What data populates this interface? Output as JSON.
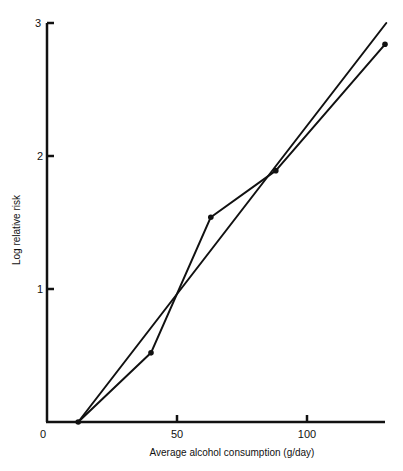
{
  "chart_data": {
    "type": "line",
    "title": "",
    "xlabel": "Average alcohol consumption (g/day)",
    "ylabel": "Log relative risk",
    "xlim": [
      0,
      131
    ],
    "ylim": [
      0,
      3
    ],
    "x_ticks": [
      0,
      50,
      100
    ],
    "y_ticks": [
      1,
      2,
      3
    ],
    "x_tick_labels": [
      "0",
      "50",
      "100"
    ],
    "y_tick_labels": [
      "1",
      "2",
      "3"
    ],
    "grid": false,
    "legend": null,
    "series": [
      {
        "name": "Observed",
        "style": "line-with-markers",
        "x": [
          12,
          40,
          63,
          88,
          130
        ],
        "y": [
          0.0,
          0.52,
          1.54,
          1.89,
          2.84
        ]
      },
      {
        "name": "Fitted linear trend",
        "style": "line",
        "x": [
          12,
          130.5
        ],
        "y": [
          0.0,
          3.0
        ]
      }
    ]
  },
  "axes": {
    "x_label": "Average alcohol consumption (g/day)",
    "y_label": "Log relative risk",
    "origin_label": "0",
    "x_tick_50": "50",
    "x_tick_100": "100",
    "y_tick_1": "1",
    "y_tick_2": "2",
    "y_tick_3": "3"
  },
  "colors": {
    "ink": "#111111",
    "background": "#ffffff"
  }
}
